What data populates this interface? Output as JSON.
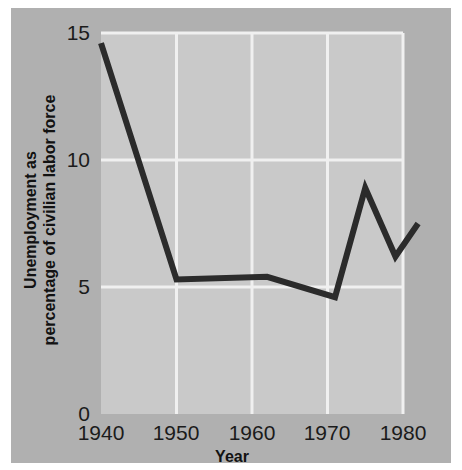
{
  "chart_data": {
    "type": "line",
    "title": "",
    "xlabel": "Year",
    "ylabel": "Unemployment as percentage of civilian labor force",
    "ylabel_line1": "Unemployment as",
    "ylabel_line2": "percentage of civilian labor force",
    "xlim": [
      1940,
      1982
    ],
    "ylim": [
      0,
      15
    ],
    "xticks": [
      1940,
      1950,
      1960,
      1970,
      1980
    ],
    "xtick_labels": [
      "1940",
      "1950",
      "1960",
      "1970",
      "1980"
    ],
    "yticks": [
      0,
      5,
      10,
      15
    ],
    "ytick_labels": [
      "0",
      "5",
      "10",
      "15"
    ],
    "grid": true,
    "grid_color": "#f0f0f0",
    "legend": "none",
    "plot_background": "#c9c9c9",
    "figure_background": "#b0b0b0",
    "line_color": "#2b2b2b",
    "line_width": 6,
    "series": [
      {
        "name": "Unemployment rate",
        "x": [
          1940,
          1950,
          1962,
          1971,
          1975,
          1979,
          1982
        ],
        "values": [
          14.6,
          5.3,
          5.4,
          4.6,
          8.9,
          6.2,
          7.5
        ]
      }
    ],
    "points": [
      {
        "x": 1940,
        "y": 14.6
      },
      {
        "x": 1950,
        "y": 5.3
      },
      {
        "x": 1962,
        "y": 5.4
      },
      {
        "x": 1971,
        "y": 4.6
      },
      {
        "x": 1975,
        "y": 8.9
      },
      {
        "x": 1979,
        "y": 6.2
      },
      {
        "x": 1982,
        "y": 7.5
      }
    ]
  }
}
